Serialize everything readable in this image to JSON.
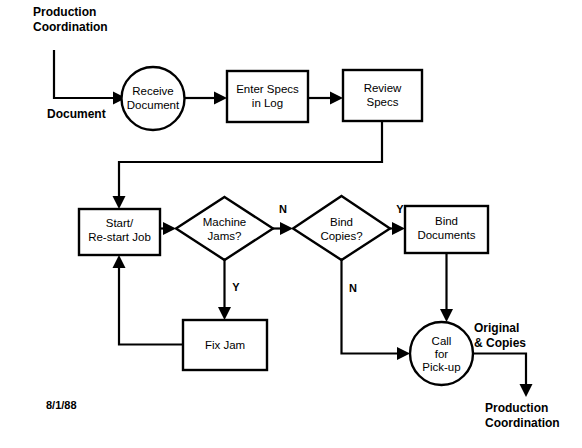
{
  "diagram": {
    "title_date": "8/1/88",
    "colors": {
      "stroke": "#000000",
      "background": "#ffffff",
      "text": "#000000"
    },
    "nodes": {
      "receive_document": {
        "line1": "Receive",
        "line2": "Document"
      },
      "enter_specs": {
        "line1": "Enter Specs",
        "line2": "in Log"
      },
      "review_specs": {
        "line1": "Review",
        "line2": "Specs"
      },
      "start_restart_job": {
        "line1": "Start/",
        "line2": "Re-start Job"
      },
      "machine_jams": {
        "line1": "Machine",
        "line2": "Jams?"
      },
      "bind_copies": {
        "line1": "Bind",
        "line2": "Copies?"
      },
      "bind_documents": {
        "line1": "Bind",
        "line2": "Documents"
      },
      "fix_jam": {
        "line1": "Fix Jam"
      },
      "call_for_pickup": {
        "line1": "Call",
        "line2": "for",
        "line3": "Pick-up"
      }
    },
    "io": {
      "source_actor_line1": "Production",
      "source_actor_line2": "Coordination",
      "input_artifact": "Document",
      "output_artifact_line1": "Original",
      "output_artifact_line2": "& Copies",
      "dest_actor_line1": "Production",
      "dest_actor_line2": "Coordination"
    },
    "edge_labels": {
      "machine_jams_no": "N",
      "machine_jams_yes": "Y",
      "bind_copies_yes": "Y",
      "bind_copies_no": "N"
    }
  }
}
